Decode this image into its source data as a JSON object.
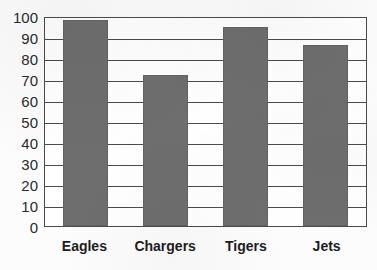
{
  "chart_data": {
    "type": "bar",
    "title": "",
    "subtitle": "",
    "xlabel": "",
    "ylabel": "",
    "categories": [
      "Eagles",
      "Chargers",
      "Tigers",
      "Jets"
    ],
    "values": [
      98,
      72,
      95,
      86
    ],
    "series": [
      {
        "name": "",
        "values": [
          98,
          72,
          95,
          86
        ]
      }
    ],
    "ylim": [
      0,
      100
    ],
    "ytick_step": 10,
    "yticks": [
      100,
      90,
      80,
      70,
      60,
      50,
      40,
      30,
      20,
      10,
      0
    ],
    "ytick_labels": [
      "100",
      "90",
      "80",
      "70",
      "60",
      "50",
      "40",
      "30",
      "20",
      "10",
      "0"
    ],
    "grid": true,
    "grid_axis": "y",
    "legend": false,
    "legend_position": "none",
    "annotations": [],
    "bar_color": "#6e6e6e",
    "axis_color": "#4a4a4a",
    "plot_background": "#ffffff",
    "figure_background": "#fcfcfc",
    "label_color": "#1d1d1d"
  }
}
